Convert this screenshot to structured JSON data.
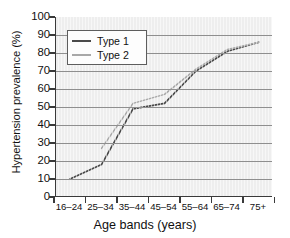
{
  "chart_data": {
    "type": "line",
    "title": "",
    "xlabel": "Age bands (years)",
    "ylabel": "Hypertension prevalence (%)",
    "categories": [
      "16–24",
      "25–34",
      "35–44",
      "45–54",
      "55–64",
      "65–74",
      "75+"
    ],
    "yticks": [
      "0",
      "10",
      "20",
      "30",
      "40",
      "50",
      "60",
      "70",
      "80",
      "90",
      "100"
    ],
    "ylim": [
      0,
      100
    ],
    "grid": "horizontal",
    "legend_position": "upper-left",
    "series": [
      {
        "name": "Type 1",
        "color": "#4a4a4a",
        "values": [
          10,
          18,
          49,
          52,
          70,
          81,
          86
        ]
      },
      {
        "name": "Type 2",
        "color": "#a8a8a8",
        "values": [
          null,
          27,
          52,
          57,
          71,
          82,
          86
        ]
      }
    ]
  },
  "legend": {
    "items": [
      {
        "label": "Type 1"
      },
      {
        "label": "Type 2"
      }
    ]
  },
  "axes": {
    "y_title": "Hypertension prevalence (%)",
    "x_title": "Age bands (years)"
  },
  "colors": {
    "plot_background": "#eeeeee",
    "gridline": "#8f8f8f",
    "axis": "#3a3a3a",
    "series_type1": "#4a4a4a",
    "series_type2": "#a8a8a8"
  }
}
